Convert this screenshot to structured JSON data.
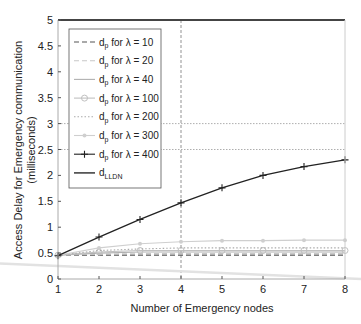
{
  "chart_data": {
    "type": "line",
    "title": "",
    "xlabel": "Number of Emergency nodes",
    "ylabel_line1": "Access Delay for Emergency communication",
    "ylabel_line2": "(milliseconds)",
    "xlim": [
      1,
      8
    ],
    "ylim": [
      0,
      5
    ],
    "x_ticks": [
      1,
      2,
      3,
      4,
      5,
      6,
      7,
      8
    ],
    "y_ticks": [
      0,
      0.5,
      1,
      1.5,
      2,
      2.5,
      3,
      3.5,
      4,
      4.5,
      5
    ],
    "y_tick_labels": [
      "0",
      "0.5",
      "1",
      "1.5",
      "2",
      "2.5",
      "3",
      "3.5",
      "4",
      "4.5",
      "5"
    ],
    "grid": false,
    "legend_position": "upper left",
    "x": [
      1,
      2,
      3,
      4,
      5,
      6,
      7,
      8
    ],
    "series": [
      {
        "name": "dp for λ = 10",
        "label_main": "d",
        "label_sub": "p",
        "label_rest": " for λ = 10",
        "color": "#555555",
        "style": "dashed",
        "marker": "none",
        "values": [
          0.46,
          0.46,
          0.46,
          0.46,
          0.46,
          0.46,
          0.46,
          0.46
        ]
      },
      {
        "name": "dp for λ = 20",
        "label_main": "d",
        "label_sub": "p",
        "label_rest": " for λ = 20",
        "color": "#c8c8c8",
        "style": "dashed",
        "marker": "none",
        "values": [
          0.46,
          0.48,
          0.49,
          0.49,
          0.49,
          0.49,
          0.49,
          0.49
        ]
      },
      {
        "name": "dp for λ = 40",
        "label_main": "d",
        "label_sub": "p",
        "label_rest": " for λ = 40",
        "color": "#b0b0b0",
        "style": "solid",
        "marker": "none",
        "values": [
          0.46,
          0.5,
          0.52,
          0.52,
          0.52,
          0.52,
          0.52,
          0.52
        ]
      },
      {
        "name": "dp for λ = 100",
        "label_main": "d",
        "label_sub": "p",
        "label_rest": " for λ = 100",
        "color": "#c0c0c0",
        "style": "solid",
        "marker": "circle",
        "values": [
          0.46,
          0.52,
          0.55,
          0.55,
          0.55,
          0.55,
          0.55,
          0.55
        ]
      },
      {
        "name": "dp for λ = 200",
        "label_main": "d",
        "label_sub": "p",
        "label_rest": " for λ = 200",
        "color": "#aaaaaa",
        "style": "dotted",
        "marker": "none",
        "values": [
          0.46,
          0.55,
          0.58,
          0.6,
          0.6,
          0.6,
          0.6,
          0.6
        ]
      },
      {
        "name": "dp for λ = 300",
        "label_main": "d",
        "label_sub": "p",
        "label_rest": " for λ = 300",
        "color": "#cfcfcf",
        "style": "solid",
        "marker": "dot",
        "values": [
          0.46,
          0.6,
          0.68,
          0.72,
          0.74,
          0.74,
          0.75,
          0.75
        ]
      },
      {
        "name": "dp for λ = 400",
        "label_main": "d",
        "label_sub": "p",
        "label_rest": " for λ = 400",
        "color": "#222222",
        "style": "solid",
        "marker": "plus",
        "values": [
          0.45,
          0.81,
          1.15,
          1.47,
          1.76,
          2.0,
          2.17,
          2.3
        ]
      },
      {
        "name": "dLLDN",
        "label_main": "d",
        "label_sub": "LLDN",
        "label_rest": "",
        "color": "#444444",
        "style": "solid",
        "marker": "none",
        "values": [
          5,
          5,
          5,
          5,
          5,
          5,
          5,
          5
        ]
      }
    ],
    "annotations": {
      "vertical_dashed_line_x": 4,
      "horizontal_dotted_lines_y": [
        3,
        2.5
      ],
      "faint_diagonal_artifact": {
        "from": [
          0,
          0.3
        ],
        "to": [
          8.5,
          0.0
        ]
      }
    }
  }
}
